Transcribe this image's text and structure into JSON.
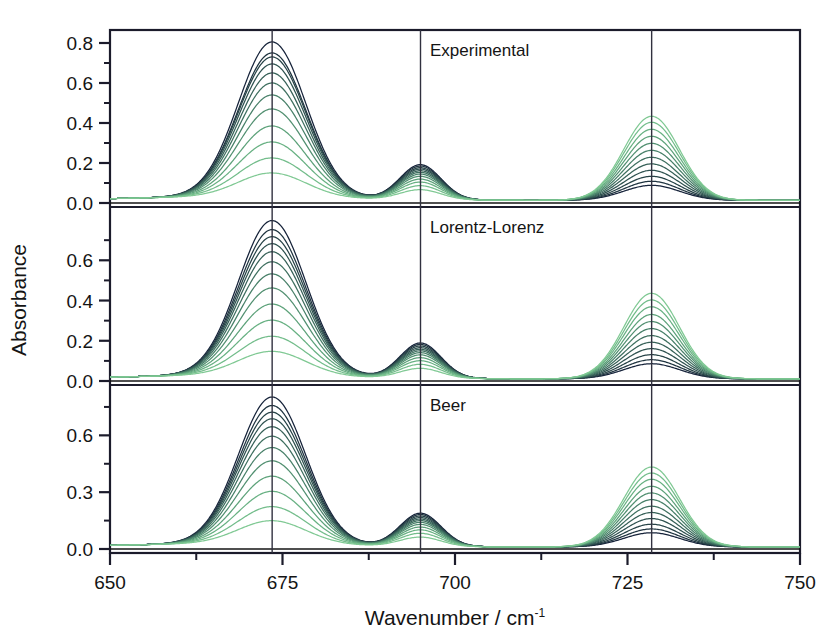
{
  "figure": {
    "title": "",
    "background_color": "#ffffff",
    "frame_color": "#1b1b2b",
    "axis_label_color": "#141414"
  },
  "axes": {
    "ylabel": "Absorbance",
    "xlabel_main": "Wavenumber / cm",
    "xlabel_exponent": "-1",
    "xlabel_full": "Wavenumber / cm-1"
  },
  "chart_data": {
    "type": "line",
    "title": "",
    "xlabel": "Wavenumber / cm-1",
    "ylabel": "Absorbance",
    "xlim": [
      650,
      750
    ],
    "xticks": [
      650,
      675,
      700,
      725,
      750
    ],
    "xtick_labels": [
      "650",
      "675",
      "700",
      "725",
      "750"
    ],
    "xminorticks": [
      662.5,
      687.5,
      712.5,
      737.5
    ],
    "grid": false,
    "legend": "none",
    "n_curves": 12,
    "color_start": "#0d1a2b",
    "color_end": "#7ec77e",
    "vertical_reference_lines": [
      673.5,
      695.0,
      728.5
    ],
    "peak_centers": [
      673.5,
      695.0,
      728.5
    ],
    "peak_widths_fwhm": [
      11.5,
      7.0,
      9.5
    ],
    "panels": [
      {
        "label": "Experimental",
        "ylim": [
          -0.02,
          0.85
        ],
        "yticks": [
          0.0,
          0.2,
          0.4,
          0.6,
          0.8
        ],
        "ytick_labels": [
          "0.0",
          "0.2",
          "0.4",
          "0.6",
          "0.8"
        ],
        "yminorticks": [
          0.1,
          0.3,
          0.5,
          0.7
        ],
        "baseline": 0.015,
        "series": [
          {
            "name": "c01",
            "color": "#16233a",
            "peak_amplitudes": [
              0.775,
              0.175,
              0.075
            ]
          },
          {
            "name": "c02",
            "color": "#1f3440",
            "peak_amplitudes": [
              0.72,
              0.168,
              0.095
            ]
          },
          {
            "name": "c03",
            "color": "#274347",
            "peak_amplitudes": [
              0.7,
              0.16,
              0.12
            ]
          },
          {
            "name": "c04",
            "color": "#2f5250",
            "peak_amplitudes": [
              0.665,
              0.153,
              0.15
            ]
          },
          {
            "name": "c05",
            "color": "#376158",
            "peak_amplitudes": [
              0.62,
              0.145,
              0.182
            ]
          },
          {
            "name": "c06",
            "color": "#3f7060",
            "peak_amplitudes": [
              0.57,
              0.137,
              0.215
            ]
          },
          {
            "name": "c07",
            "color": "#488069",
            "peak_amplitudes": [
              0.51,
              0.128,
              0.25
            ]
          },
          {
            "name": "c08",
            "color": "#529071",
            "peak_amplitudes": [
              0.44,
              0.117,
              0.285
            ]
          },
          {
            "name": "c09",
            "color": "#5da27a",
            "peak_amplitudes": [
              0.355,
              0.103,
              0.32
            ]
          },
          {
            "name": "c10",
            "color": "#68b183",
            "peak_amplitudes": [
              0.275,
              0.088,
              0.355
            ]
          },
          {
            "name": "c11",
            "color": "#73bd8b",
            "peak_amplitudes": [
              0.195,
              0.07,
              0.39
            ]
          },
          {
            "name": "c12",
            "color": "#80c994",
            "peak_amplitudes": [
              0.12,
              0.05,
              0.42
            ]
          }
        ]
      },
      {
        "label": "Lorentz-Lorenz",
        "ylim": [
          -0.02,
          0.85
        ],
        "yticks": [
          0.0,
          0.2,
          0.4,
          0.6
        ],
        "ytick_labels": [
          "0.0",
          "0.2",
          "0.4",
          "0.6"
        ],
        "yminorticks": [
          0.1,
          0.3,
          0.5,
          0.7
        ],
        "baseline": 0.012,
        "series": [
          {
            "name": "c01",
            "color": "#16233a",
            "peak_amplitudes": [
              0.77,
              0.175,
              0.075
            ]
          },
          {
            "name": "c02",
            "color": "#1f3440",
            "peak_amplitudes": [
              0.725,
              0.168,
              0.095
            ]
          },
          {
            "name": "c03",
            "color": "#274347",
            "peak_amplitudes": [
              0.69,
              0.16,
              0.12
            ]
          },
          {
            "name": "c04",
            "color": "#2f5250",
            "peak_amplitudes": [
              0.655,
              0.152,
              0.15
            ]
          },
          {
            "name": "c05",
            "color": "#376158",
            "peak_amplitudes": [
              0.615,
              0.144,
              0.182
            ]
          },
          {
            "name": "c06",
            "color": "#3f7060",
            "peak_amplitudes": [
              0.565,
              0.136,
              0.215
            ]
          },
          {
            "name": "c07",
            "color": "#488069",
            "peak_amplitudes": [
              0.505,
              0.127,
              0.25
            ]
          },
          {
            "name": "c08",
            "color": "#529071",
            "peak_amplitudes": [
              0.435,
              0.116,
              0.285
            ]
          },
          {
            "name": "c09",
            "color": "#5da27a",
            "peak_amplitudes": [
              0.355,
              0.102,
              0.32
            ]
          },
          {
            "name": "c10",
            "color": "#68b183",
            "peak_amplitudes": [
              0.275,
              0.087,
              0.358
            ]
          },
          {
            "name": "c11",
            "color": "#73bd8b",
            "peak_amplitudes": [
              0.195,
              0.069,
              0.392
            ]
          },
          {
            "name": "c12",
            "color": "#80c994",
            "peak_amplitudes": [
              0.12,
              0.049,
              0.425
            ]
          }
        ]
      },
      {
        "label": "Beer",
        "ylim": [
          -0.02,
          0.85
        ],
        "yticks": [
          0.0,
          0.3,
          0.6
        ],
        "ytick_labels": [
          "0.0",
          "0.3",
          "0.6"
        ],
        "yminorticks": [
          0.15,
          0.45,
          0.75
        ],
        "baseline": 0.012,
        "series": [
          {
            "name": "c01",
            "color": "#16233a",
            "peak_amplitudes": [
              0.775,
              0.175,
              0.075
            ]
          },
          {
            "name": "c02",
            "color": "#1f3440",
            "peak_amplitudes": [
              0.73,
              0.168,
              0.095
            ]
          },
          {
            "name": "c03",
            "color": "#274347",
            "peak_amplitudes": [
              0.695,
              0.16,
              0.12
            ]
          },
          {
            "name": "c04",
            "color": "#2f5250",
            "peak_amplitudes": [
              0.66,
              0.152,
              0.15
            ]
          },
          {
            "name": "c05",
            "color": "#376158",
            "peak_amplitudes": [
              0.618,
              0.144,
              0.182
            ]
          },
          {
            "name": "c06",
            "color": "#3f7060",
            "peak_amplitudes": [
              0.568,
              0.136,
              0.215
            ]
          },
          {
            "name": "c07",
            "color": "#488069",
            "peak_amplitudes": [
              0.508,
              0.127,
              0.25
            ]
          },
          {
            "name": "c08",
            "color": "#529071",
            "peak_amplitudes": [
              0.438,
              0.116,
              0.285
            ]
          },
          {
            "name": "c09",
            "color": "#5da27a",
            "peak_amplitudes": [
              0.357,
              0.102,
              0.32
            ]
          },
          {
            "name": "c10",
            "color": "#68b183",
            "peak_amplitudes": [
              0.277,
              0.087,
              0.357
            ]
          },
          {
            "name": "c11",
            "color": "#73bd8b",
            "peak_amplitudes": [
              0.196,
              0.069,
              0.39
            ]
          },
          {
            "name": "c12",
            "color": "#80c994",
            "peak_amplitudes": [
              0.122,
              0.049,
              0.422
            ]
          }
        ]
      }
    ]
  }
}
